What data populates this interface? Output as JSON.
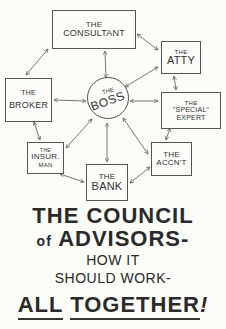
{
  "diagram": {
    "nodes": {
      "consultant": {
        "line1": "THE",
        "line2": "CONSULTANT"
      },
      "atty": {
        "line1": "THE",
        "line2": "ATTY"
      },
      "broker": {
        "line1": "THE",
        "line2": "BROKER"
      },
      "boss": {
        "line1": "THE",
        "line2": "BOSS"
      },
      "expert": {
        "line1": "THE",
        "line2": "\"SPECIAL\"",
        "line3": "EXPERT"
      },
      "insurman": {
        "line1": "THE",
        "line2": "INSUR.",
        "line3": "MAN"
      },
      "accnt": {
        "line1": "THE",
        "line2": "ACCN'T"
      },
      "bank": {
        "line1": "THE",
        "line2": "BANK"
      }
    },
    "edges": [
      [
        "consultant",
        "atty"
      ],
      [
        "consultant",
        "broker"
      ],
      [
        "consultant",
        "boss"
      ],
      [
        "atty",
        "boss"
      ],
      [
        "atty",
        "expert"
      ],
      [
        "broker",
        "boss"
      ],
      [
        "broker",
        "insurman"
      ],
      [
        "boss",
        "expert"
      ],
      [
        "boss",
        "insurman"
      ],
      [
        "boss",
        "bank"
      ],
      [
        "boss",
        "accnt"
      ],
      [
        "expert",
        "accnt"
      ],
      [
        "insurman",
        "bank"
      ],
      [
        "bank",
        "accnt"
      ]
    ]
  },
  "caption": {
    "line1": "THE COUNCIL",
    "line2_of": "of",
    "line2_main": "ADVISORS-",
    "line3": "HOW IT",
    "line4": "SHOULD WORK-",
    "line5_a": "ALL",
    "line5_b": "TOGETHER",
    "line5_c": "!"
  }
}
